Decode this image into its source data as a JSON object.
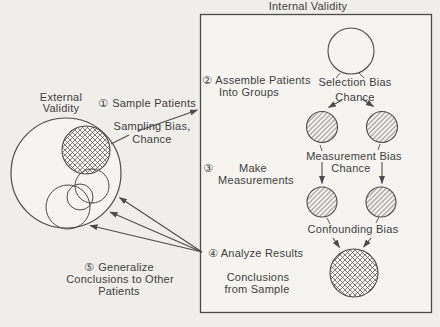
{
  "colors": {
    "paper": "#efeeea",
    "box_fill": "#f5f4f0",
    "ink": "#3e3e3e",
    "line": "#4b4b4b",
    "circle_fill": "#f7f6f2"
  },
  "internal": {
    "title": "Internal Validity",
    "step2": {
      "num": "②",
      "line1": "Assemble Patients",
      "line2": "Into Groups"
    },
    "selection_bias": {
      "line1": "Selection Bias",
      "line2": "Chance"
    },
    "step3": {
      "num": "③",
      "line1": "Make",
      "line2": "Measurements"
    },
    "measurement_bias": {
      "line1": "Measurement Bias",
      "line2": "Chance"
    },
    "step4": {
      "num": "④",
      "label": "Analyze Results"
    },
    "confounding_bias": {
      "label": "Confounding Bias"
    },
    "conclusions": {
      "line1": "Conclusions",
      "line2": "from Sample"
    }
  },
  "external": {
    "label": {
      "line1": "External",
      "line2": "Validity"
    },
    "step1": {
      "num": "①",
      "label": "Sample Patients"
    },
    "sampling_bias": {
      "line1": "Sampling Bias,",
      "line2": "Chance"
    },
    "step5": {
      "num": "⑤",
      "line1": "Generalize",
      "line2": "Conclusions to Other",
      "line3": "Patients"
    }
  }
}
